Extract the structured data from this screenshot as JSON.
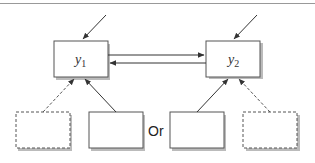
{
  "diagram": {
    "nodes": {
      "y1": {
        "label": "y",
        "subscript": "1"
      },
      "y2": {
        "label": "y",
        "subscript": "2"
      },
      "left_dashed": {
        "label": ""
      },
      "left_solid": {
        "label": ""
      },
      "right_solid": {
        "label": ""
      },
      "right_dashed": {
        "label": ""
      }
    },
    "connector_text": "Or",
    "colors": {
      "box_border": "#555555",
      "box_shadow": "#bbbbbb",
      "arrow": "#333333",
      "top_rule": "#999999"
    }
  }
}
